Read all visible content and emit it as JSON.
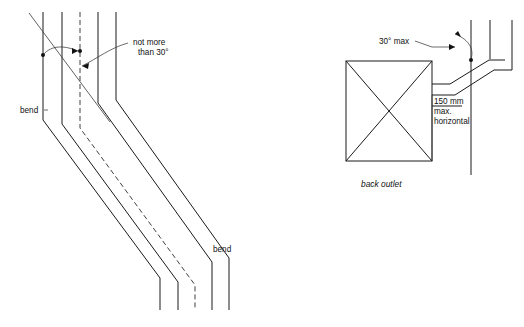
{
  "figure": {
    "title": "",
    "background_color": "#ffffff",
    "line_color": "#1a1a1a",
    "text_color": "#111111"
  },
  "left_diagram": {
    "name": "offset-pipe-run-elevation",
    "labels": {
      "angle_note_line1": "not more",
      "angle_note_line2": "than 30°",
      "bend_top": "bend",
      "bend_bottom": "bend"
    }
  },
  "right_diagram": {
    "name": "back-outlet-detail",
    "labels": {
      "angle_note": "30° max",
      "dimension_line1": "150 mm",
      "dimension_line2": "max.",
      "dimension_line3": "horizontal",
      "caption": "back outlet"
    }
  },
  "values": {
    "max_angle_degrees": 30,
    "max_horizontal_mm": 150,
    "angle_unit": "degrees",
    "length_unit": "mm"
  }
}
